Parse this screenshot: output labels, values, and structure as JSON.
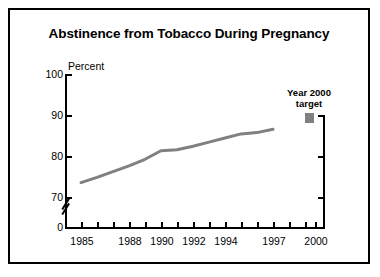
{
  "figure": {
    "title": "Abstinence from Tobacco During Pregnancy",
    "border_color": "#000000",
    "background": "#ffffff"
  },
  "legend": {
    "label": "Year 2000\ntarget",
    "swatch_color": "#808080",
    "swatch_name": "year-2000-target-swatch"
  },
  "chart_data": {
    "type": "line",
    "title": "Abstinence from Tobacco During Pregnancy",
    "xlabel": "",
    "ylabel": "Percent",
    "ylim": [
      0,
      100
    ],
    "y_axis_break": true,
    "y_break_between": [
      0,
      70
    ],
    "yticks": [
      0,
      70,
      80,
      90,
      100
    ],
    "ytick_labels": [
      "0",
      "70",
      "80",
      "90",
      "100"
    ],
    "xlim": [
      1984,
      2001
    ],
    "xticks": [
      1985,
      1986,
      1987,
      1988,
      1989,
      1990,
      1991,
      1992,
      1993,
      1994,
      1995,
      1996,
      1997,
      1998,
      1999,
      2000
    ],
    "xtick_labels_shown": [
      "1985",
      "1988",
      "1990",
      "1992",
      "1994",
      "1997",
      "2000"
    ],
    "grid": false,
    "legend_position": "upper right",
    "series": [
      {
        "name": "Abstinence from tobacco during pregnancy",
        "color": "#808080",
        "line_width": 3,
        "x": [
          1985,
          1986,
          1987,
          1988,
          1989,
          1990,
          1991,
          1992,
          1993,
          1994,
          1995,
          1996,
          1997
        ],
        "values": [
          73.5,
          74.8,
          76.2,
          77.6,
          79.2,
          81.3,
          81.5,
          82.4,
          83.4,
          84.4,
          85.4,
          85.7,
          86.5
        ]
      }
    ],
    "target_marker": {
      "name": "Year 2000 target",
      "x": 2000,
      "value": 89,
      "color": "#808080",
      "shape": "square"
    }
  },
  "axes": {
    "y_label_text": "Percent"
  }
}
